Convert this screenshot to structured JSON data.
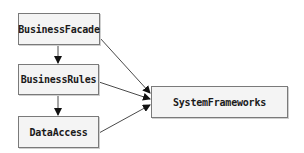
{
  "diagram": {
    "type": "dependency-diagram",
    "nodes": [
      {
        "id": "BusinessFacade",
        "label": "BusinessFacade",
        "x": 18,
        "y": 13,
        "w": 82,
        "h": 32
      },
      {
        "id": "BusinessRules",
        "label": "BusinessRules",
        "x": 18,
        "y": 64,
        "w": 81,
        "h": 31
      },
      {
        "id": "DataAccess",
        "label": "DataAccess",
        "x": 18,
        "y": 116,
        "w": 81,
        "h": 32
      },
      {
        "id": "SystemFrameworks",
        "label": "SystemFrameworks",
        "x": 151,
        "y": 86,
        "w": 137,
        "h": 32
      }
    ],
    "edges": [
      {
        "from": "BusinessFacade",
        "to": "BusinessRules"
      },
      {
        "from": "BusinessRules",
        "to": "DataAccess"
      },
      {
        "from": "BusinessFacade",
        "to": "SystemFrameworks"
      },
      {
        "from": "BusinessRules",
        "to": "SystemFrameworks"
      },
      {
        "from": "DataAccess",
        "to": "SystemFrameworks"
      }
    ],
    "colors": {
      "node_fill": "#f4f4f4",
      "node_border": "#7a7a7a",
      "edge": "#4a4a4a",
      "text": "#1a1a1a"
    }
  }
}
